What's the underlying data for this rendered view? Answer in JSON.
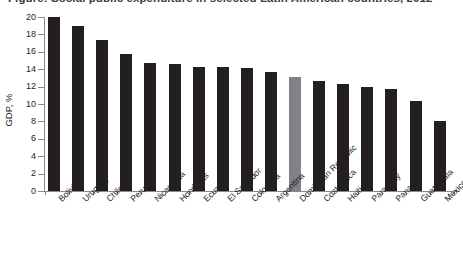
{
  "figure": {
    "title": "Figure: Social public expenditure in selected Latin American countries, 2012",
    "title_clipped_note": "title row is cropped at the top edge of the screenshot",
    "bullet_icon": "square-bullet-icon"
  },
  "axes": {
    "ylabel": "GDP, %",
    "yticks": [
      "0",
      "2",
      "4",
      "6",
      "8",
      "10",
      "12",
      "14",
      "16",
      "18",
      "20"
    ]
  },
  "colors": {
    "bar_default": "#231f20",
    "bar_highlight": "#808285",
    "axis": "#8a8a8e",
    "background": "#ffffff",
    "text": "#231f20"
  },
  "chart_data": {
    "type": "bar",
    "title": "Figure: Social public expenditure in selected Latin American countries, 2012",
    "xlabel": "",
    "ylabel": "GDP, %",
    "ylim": [
      0,
      20
    ],
    "ytick_step": 2,
    "grid": false,
    "legend": null,
    "highlight_category": "Dominican Republic",
    "categories": [
      "Bolivia",
      "Uruguay",
      "Chile",
      "Peru",
      "Nicaragua",
      "Honduras",
      "Ecuador",
      "El Salvador",
      "Colombia",
      "Argentina",
      "Dominican Republic",
      "Costa Rica",
      "Haiti",
      "Paraguay",
      "Panama",
      "Guatemala",
      "Mexico"
    ],
    "values": [
      20.0,
      19.0,
      17.4,
      15.8,
      14.7,
      14.6,
      14.3,
      14.2,
      14.1,
      13.7,
      13.1,
      12.7,
      12.3,
      11.9,
      11.7,
      10.3,
      8.1
    ]
  }
}
